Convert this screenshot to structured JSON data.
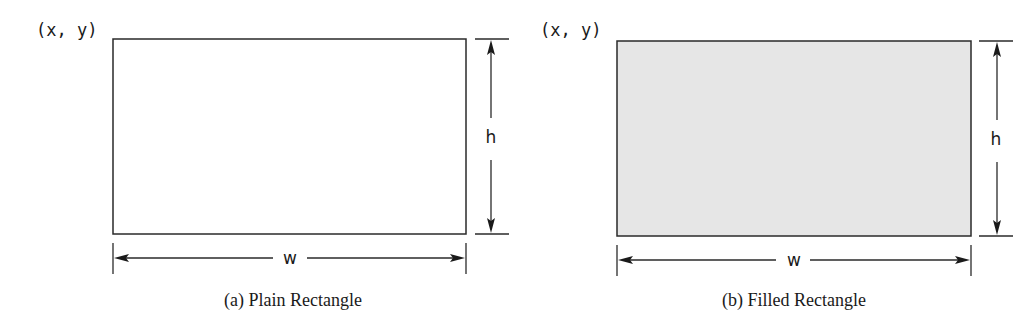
{
  "figures": [
    {
      "id": "a",
      "origin_label": "(x, y)",
      "height_label": "h",
      "width_label": "w",
      "caption": "(a) Plain Rectangle",
      "fill": "#ffffff",
      "geometry": {
        "rect": {
          "x": 113,
          "y": 39,
          "w": 353,
          "h": 195
        },
        "origin_label_pos": {
          "x": 36,
          "y": 36
        },
        "h_arrow_x": 491,
        "h_ext": {
          "x1": 475,
          "x2": 509
        },
        "h_label_pos": {
          "x": 491,
          "y": 143
        },
        "h_gap": {
          "top": 118,
          "bottom": 160
        },
        "w_arrow_y": 258,
        "w_tick": {
          "y1": 243,
          "y2": 274
        },
        "w_label_pos": {
          "x": 290,
          "y": 264
        },
        "w_gap": {
          "left": 273,
          "right": 307
        },
        "caption_pos": {
          "x": 293,
          "y": 306
        }
      }
    },
    {
      "id": "b",
      "origin_label": "(x, y)",
      "height_label": "h",
      "width_label": "w",
      "caption": "(b) Filled Rectangle",
      "fill": "#e6e6e6",
      "geometry": {
        "rect": {
          "x": 617,
          "y": 41,
          "w": 354,
          "h": 195
        },
        "origin_label_pos": {
          "x": 540,
          "y": 36
        },
        "h_arrow_x": 997,
        "h_ext": {
          "x1": 979,
          "x2": 1013
        },
        "h_label_pos": {
          "x": 996,
          "y": 145
        },
        "h_gap": {
          "top": 120,
          "bottom": 162
        },
        "w_arrow_y": 260,
        "w_tick": {
          "y1": 245,
          "y2": 276
        },
        "w_label_pos": {
          "x": 794,
          "y": 266
        },
        "w_gap": {
          "left": 776,
          "right": 810
        },
        "caption_pos": {
          "x": 794,
          "y": 306
        }
      }
    }
  ],
  "colors": {
    "stroke": "#2a2a2a",
    "text": "#1a1a1a",
    "fill_plain": "#ffffff",
    "fill_filled": "#e6e6e6",
    "background": "#ffffff"
  }
}
